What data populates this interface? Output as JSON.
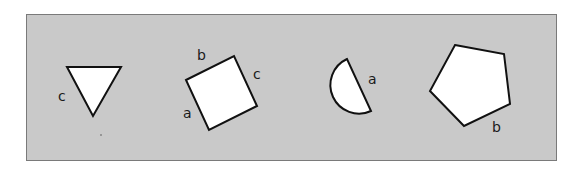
{
  "panel": {
    "fill": "#c9c9c9",
    "border": "#7a7a7a"
  },
  "shapes": [
    {
      "name": "triangle",
      "labels": [
        {
          "text": "c",
          "x": 58,
          "y": 101
        }
      ]
    },
    {
      "name": "square",
      "labels": [
        {
          "text": "b",
          "x": 197,
          "y": 60
        },
        {
          "text": "c",
          "x": 253,
          "y": 79
        },
        {
          "text": "a",
          "x": 183,
          "y": 118
        }
      ]
    },
    {
      "name": "semicircle",
      "labels": [
        {
          "text": "a",
          "x": 368,
          "y": 84
        }
      ]
    },
    {
      "name": "pentagon",
      "labels": [
        {
          "text": "b",
          "x": 492,
          "y": 132
        }
      ]
    }
  ]
}
